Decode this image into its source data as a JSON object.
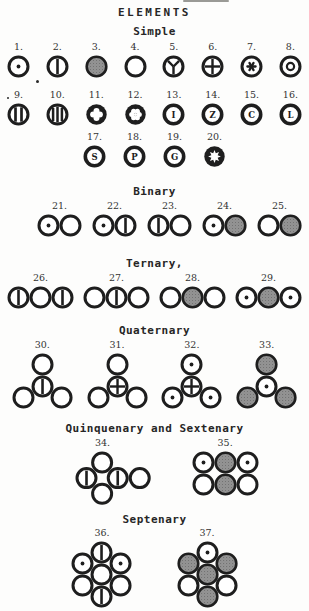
{
  "title": "ELEMENTS",
  "colors": {
    "ink": "#1e1e1e",
    "paper": "#ffffff",
    "number": "#333333",
    "hatch_light": "#b3b3b3",
    "hatch_dark": "#6b6b6b"
  },
  "sections": [
    {
      "heading": "Simple",
      "rows": [
        {
          "items": [
            {
              "num": "1.",
              "layout": "single",
              "glyphs": [
                "dot"
              ]
            },
            {
              "num": "2.",
              "layout": "single",
              "glyphs": [
                "bar"
              ]
            },
            {
              "num": "3.",
              "layout": "single",
              "glyphs": [
                "hatched"
              ]
            },
            {
              "num": "4.",
              "layout": "single",
              "glyphs": [
                "empty"
              ]
            },
            {
              "num": "5.",
              "layout": "single",
              "glyphs": [
                "spokes3"
              ]
            },
            {
              "num": "6.",
              "layout": "single",
              "glyphs": [
                "cross"
              ]
            },
            {
              "num": "7.",
              "layout": "single",
              "glyphs": [
                "star"
              ]
            },
            {
              "num": "8.",
              "layout": "single",
              "glyphs": [
                "ringdot"
              ]
            }
          ]
        },
        {
          "items": [
            {
              "num": "9.",
              "layout": "single",
              "glyphs": [
                "stripes2"
              ]
            },
            {
              "num": "10.",
              "layout": "single",
              "glyphs": [
                "stripes3"
              ]
            },
            {
              "num": "11.",
              "layout": "single",
              "glyphs": [
                "quatrefoil"
              ]
            },
            {
              "num": "12.",
              "layout": "single",
              "glyphs": [
                "flower6"
              ]
            },
            {
              "num": "13.",
              "layout": "single",
              "glyphs": [
                "letter-I"
              ]
            },
            {
              "num": "14.",
              "layout": "single",
              "glyphs": [
                "letter-Z"
              ]
            },
            {
              "num": "15.",
              "layout": "single",
              "glyphs": [
                "letter-C"
              ]
            },
            {
              "num": "16.",
              "layout": "single",
              "glyphs": [
                "letter-L"
              ]
            }
          ]
        },
        {
          "items": [
            {
              "num": "17.",
              "layout": "single",
              "glyphs": [
                "letter-S"
              ]
            },
            {
              "num": "18.",
              "layout": "single",
              "glyphs": [
                "letter-P"
              ]
            },
            {
              "num": "19.",
              "layout": "single",
              "glyphs": [
                "letter-G"
              ]
            },
            {
              "num": "20.",
              "layout": "single",
              "glyphs": [
                "gear"
              ]
            }
          ]
        }
      ]
    },
    {
      "heading": "Binary",
      "rows": [
        {
          "items": [
            {
              "num": "21.",
              "layout": "pair",
              "glyphs": [
                "dot",
                "empty"
              ]
            },
            {
              "num": "22.",
              "layout": "pair",
              "glyphs": [
                "dot",
                "bar"
              ]
            },
            {
              "num": "23.",
              "layout": "pair",
              "glyphs": [
                "bar",
                "empty"
              ]
            },
            {
              "num": "24.",
              "layout": "pair",
              "glyphs": [
                "dot",
                "hatched"
              ]
            },
            {
              "num": "25.",
              "layout": "pair",
              "glyphs": [
                "empty",
                "hatched"
              ]
            }
          ]
        }
      ]
    },
    {
      "heading": "Ternary,",
      "rows": [
        {
          "items": [
            {
              "num": "26.",
              "layout": "triple",
              "glyphs": [
                "bar",
                "empty",
                "bar"
              ]
            },
            {
              "num": "27.",
              "layout": "triple",
              "glyphs": [
                "empty",
                "bar",
                "empty"
              ]
            },
            {
              "num": "28.",
              "layout": "triple",
              "glyphs": [
                "empty",
                "hatched",
                "empty"
              ]
            },
            {
              "num": "29.",
              "layout": "triple",
              "glyphs": [
                "dot",
                "hatched",
                "dot"
              ]
            }
          ]
        }
      ]
    },
    {
      "heading": "Quaternary",
      "rows": [
        {
          "items": [
            {
              "num": "30.",
              "layout": "tetra",
              "glyphs": [
                "empty",
                "bar",
                "empty",
                "empty"
              ]
            },
            {
              "num": "31.",
              "layout": "tetra",
              "glyphs": [
                "empty",
                "cross",
                "empty",
                "empty"
              ]
            },
            {
              "num": "32.",
              "layout": "tetra",
              "glyphs": [
                "dot",
                "cross",
                "dot",
                "dot"
              ]
            },
            {
              "num": "33.",
              "layout": "tetra",
              "glyphs": [
                "hatched",
                "dot",
                "hatched",
                "hatched"
              ]
            }
          ]
        }
      ]
    },
    {
      "heading": "Quinquenary and Sextenary",
      "rows": [
        {
          "items": [
            {
              "num": "34.",
              "layout": "penta",
              "glyphs": [
                "empty",
                "bar",
                "bar",
                "empty",
                "empty"
              ]
            },
            {
              "num": "35.",
              "layout": "hexa",
              "glyphs": [
                "dot",
                "hatched",
                "dot",
                "empty",
                "hatched",
                "empty"
              ]
            }
          ]
        }
      ]
    },
    {
      "heading": "Septenary",
      "rows": [
        {
          "items": [
            {
              "num": "36.",
              "layout": "hepta",
              "glyphs": [
                "bar",
                "dot",
                "dot",
                "empty",
                "empty",
                "empty",
                "bar"
              ]
            },
            {
              "num": "37.",
              "layout": "hepta",
              "glyphs": [
                "dot",
                "hatched",
                "hatched",
                "hatched",
                "empty",
                "empty",
                "hatched"
              ]
            }
          ]
        }
      ]
    }
  ]
}
